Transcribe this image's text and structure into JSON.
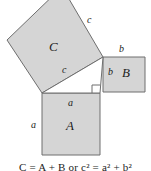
{
  "figure": {
    "background_color": "#ffffff",
    "square_fill_color": "#d5d5d5",
    "stroke_color": "#6e6e6e",
    "text_color": "#1c1c1c",
    "squares": [
      {
        "id": "square-a",
        "name": "A",
        "label": "A",
        "side_label": "a",
        "position": "bottom",
        "orientation": "axis-aligned",
        "corners": "42,93 100,93 100,155 42,155"
      },
      {
        "id": "square-b",
        "name": "B",
        "label": "B",
        "side_label": "b",
        "position": "right",
        "orientation": "axis-aligned",
        "corners": "103,57 145,57 145,92 103,92"
      },
      {
        "id": "square-c",
        "name": "C",
        "label": "C",
        "side_label": "c",
        "position": "upper-left",
        "orientation": "tilted",
        "corners": "7,40 62,-13 103,57 42,93"
      }
    ],
    "triangle": {
      "id": "right-triangle",
      "vertices": "42,93 103,57 100,93",
      "right_angle_at": "100,93"
    },
    "labels": {
      "square_c_name": "C",
      "square_b_name": "B",
      "square_a_name": "A",
      "side_c_upper": "c",
      "side_c_lower": "c",
      "side_b_top": "b",
      "side_b_inner": "b",
      "side_a_top": "a",
      "side_a_left": "a"
    },
    "caption": "C = A + B or c² = a² + b²"
  }
}
